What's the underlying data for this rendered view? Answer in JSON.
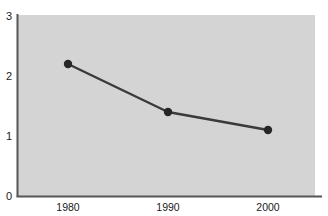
{
  "chart_data": {
    "type": "line",
    "title": "",
    "subtitle": "",
    "xlabel": "",
    "ylabel": "",
    "x": [
      1980,
      1990,
      2000
    ],
    "categories": [
      "1980",
      "1990",
      "2000"
    ],
    "values": [
      2.2,
      1.4,
      1.1
    ],
    "series": [
      {
        "name": "",
        "values": [
          2.2,
          1.4,
          1.1
        ]
      }
    ],
    "xlim": [
      1975,
      2007
    ],
    "ylim": [
      0,
      3
    ],
    "ytick_labels": [
      "0",
      "1",
      "2",
      "3"
    ],
    "ytick_values": [
      0,
      1,
      2,
      3
    ],
    "xtick_labels": [
      "1980",
      "1990",
      "2000"
    ],
    "xtick_values": [
      1980,
      1990,
      2000
    ],
    "grid": false,
    "legend": false,
    "legend_position": "none",
    "markers": "filled-circle",
    "annotations": []
  },
  "style": {
    "page_background": "#ffffff",
    "plot_background": "#d4d4d4",
    "axis_color": "#555555",
    "line_color": "#3a3a3a",
    "marker_color": "#262626",
    "tick_label_color": "#1a1a1a"
  },
  "ytick_labels": {
    "t0": "0",
    "t1": "1",
    "t2": "2",
    "t3": "3"
  },
  "xtick_labels": {
    "t0": "1980",
    "t1": "1990",
    "t2": "2000"
  }
}
